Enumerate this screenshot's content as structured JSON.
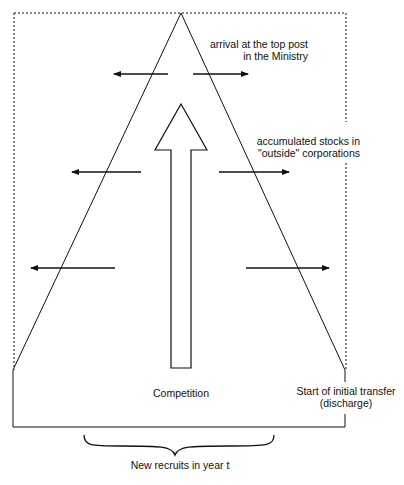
{
  "labels": {
    "top_post": [
      "arrival at the top post",
      "in the Ministry"
    ],
    "outside": [
      "accumulated stocks in",
      "\"outside\" corporations"
    ],
    "competition": "Competition",
    "initial_transfer": [
      "Start of initial transfer",
      "(discharge)"
    ],
    "new_recruits": "New recruits in year t"
  },
  "colors": {
    "line": "#111111",
    "background": "#ffffff"
  }
}
